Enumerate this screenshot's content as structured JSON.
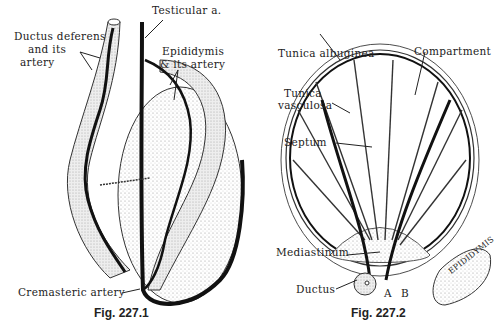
{
  "figures": [
    {
      "caption": "Fig. 227.1",
      "labels": {
        "testicular": "Testicular a.",
        "ductus_line1": "Ductus deferens",
        "ductus_line2": "and its",
        "ductus_line3": "artery",
        "epid_line1": "Epididymis",
        "epid_line2": "& its artery",
        "cremasteric": "Cremasteric artery"
      }
    },
    {
      "caption": "Fig. 227.2",
      "labels": {
        "albuginea": "Tunica albuginea",
        "compartment": "Compartment",
        "vasc_line1": "Tunica",
        "vasc_line2": "vasculosa",
        "septum": "Septum",
        "mediastinum": "Mediastinum",
        "ductus": "Ductus",
        "a": "A",
        "b": "B",
        "epididymis": "EPIDIDYMIS"
      }
    }
  ]
}
